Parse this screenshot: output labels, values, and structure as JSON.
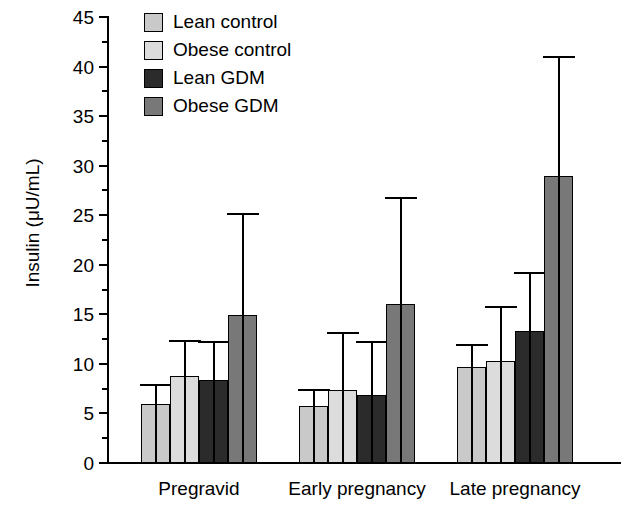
{
  "chart_data": {
    "type": "bar",
    "title": "",
    "xlabel": "",
    "ylabel": "Insulin (μU/mL)",
    "ylim": [
      0,
      45
    ],
    "ytick_step": 5,
    "yminor_step": 2.5,
    "grid": false,
    "legend_position": "top-left",
    "error_bars": "upper-only",
    "categories": [
      "Pregravid",
      "Early pregnancy",
      "Late pregnancy"
    ],
    "ytick_labels": [
      "0",
      "5",
      "10",
      "15",
      "20",
      "25",
      "30",
      "35",
      "40",
      "45"
    ],
    "ytick_values": [
      0,
      5,
      10,
      15,
      20,
      25,
      30,
      35,
      40,
      45
    ],
    "series": [
      {
        "name": "Lean control",
        "color": "#c9c9c9",
        "values": [
          6.0,
          5.8,
          9.7
        ],
        "error_upper": [
          7.9,
          7.4,
          11.9
        ]
      },
      {
        "name": "Obese control",
        "color": "#dcdcdc",
        "values": [
          8.8,
          7.4,
          10.3
        ],
        "error_upper": [
          12.3,
          13.1,
          15.7
        ]
      },
      {
        "name": "Lean GDM",
        "color": "#2b2b2b",
        "values": [
          8.4,
          6.9,
          13.3
        ],
        "error_upper": [
          12.2,
          12.2,
          19.2
        ]
      },
      {
        "name": "Obese GDM",
        "color": "#787878",
        "values": [
          14.9,
          16.0,
          29.0
        ],
        "error_upper": [
          25.1,
          26.7,
          41.0
        ]
      }
    ]
  },
  "legend": {
    "items": [
      {
        "label": "Lean control",
        "swatch": "legend-swatch-lean-control"
      },
      {
        "label": "Obese control",
        "swatch": "legend-swatch-obese-control"
      },
      {
        "label": "Lean GDM",
        "swatch": "legend-swatch-lean-gdm"
      },
      {
        "label": "Obese GDM",
        "swatch": "legend-swatch-obese-gdm"
      }
    ]
  }
}
